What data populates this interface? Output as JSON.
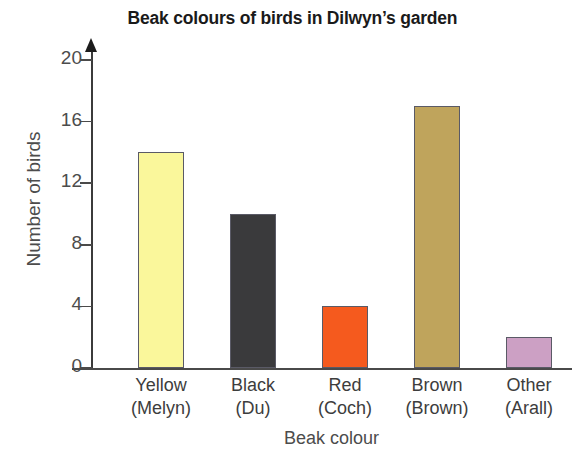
{
  "chart_data": {
    "type": "bar",
    "title": "Beak colours of birds in Dilwyn’s garden",
    "xlabel": "Beak colour",
    "ylabel": "Number of birds",
    "categories": [
      "Yellow",
      "Black",
      "Red",
      "Brown",
      "Other"
    ],
    "categories_welsh": [
      "(Melyn)",
      "(Du)",
      "(Coch)",
      "(Brown)",
      "(Arall)"
    ],
    "values": [
      14,
      10,
      4,
      17,
      2
    ],
    "ylim": [
      0,
      20
    ],
    "yticks": [
      0,
      4,
      8,
      12,
      16,
      20
    ],
    "ytick_labels": [
      "0",
      "4",
      "8",
      "12",
      "16",
      "20"
    ],
    "grid": false,
    "legend": false,
    "bar_colors": [
      "#FAF79B",
      "#3A3A3C",
      "#F55A1E",
      "#BFA45C",
      "#CCA0C4"
    ],
    "bar_edge_color": "#5A5A66",
    "axis_color": "#4A4A4A",
    "bars": [
      {
        "category": "Yellow",
        "welsh": "(Melyn)",
        "value": 14,
        "color": "#FAF79B"
      },
      {
        "category": "Black",
        "welsh": "(Du)",
        "value": 10,
        "color": "#3A3A3C"
      },
      {
        "category": "Red",
        "welsh": "(Coch)",
        "value": 4,
        "color": "#F55A1E"
      },
      {
        "category": "Brown",
        "welsh": "(Brown)",
        "value": 17,
        "color": "#BFA45C"
      },
      {
        "category": "Other",
        "welsh": "(Arall)",
        "value": 2,
        "color": "#CCA0C4"
      }
    ]
  }
}
